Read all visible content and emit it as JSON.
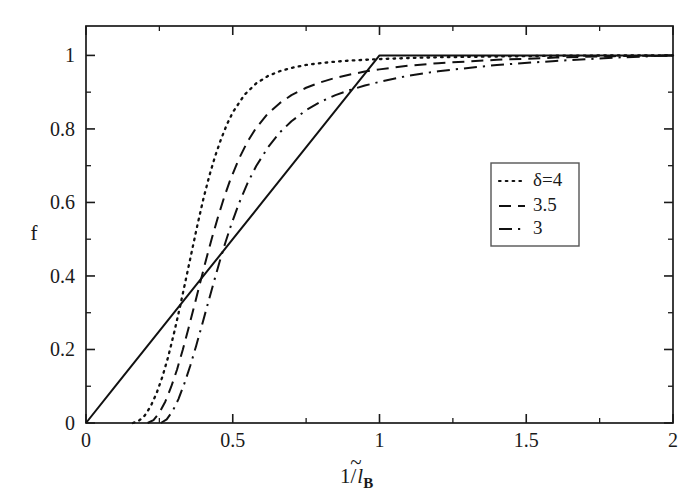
{
  "chart_data": {
    "type": "line",
    "title": "",
    "xlabel": "1/l̃_B",
    "xlabel_parts": {
      "prefix": "1/",
      "symbol": "l",
      "accent": "~",
      "subscript": "B"
    },
    "ylabel": "f",
    "xlim": [
      0,
      2
    ],
    "ylim": [
      0,
      1.08
    ],
    "grid": false,
    "legend_position": "center-right",
    "xticks": [
      "0",
      "0.5",
      "1",
      "1.5",
      "2"
    ],
    "xtick_values": [
      0,
      0.5,
      1,
      1.5,
      2
    ],
    "xminor_values": [
      0.25,
      0.75,
      1.25,
      1.75
    ],
    "yticks": [
      "0",
      "0.2",
      "0.4",
      "0.6",
      "0.8",
      "1"
    ],
    "ytick_values": [
      0,
      0.2,
      0.4,
      0.6,
      0.8,
      1
    ],
    "yminor_values": [
      0.1,
      0.3,
      0.5,
      0.7,
      0.9
    ],
    "series": [
      {
        "name": "linear",
        "style": "solid",
        "in_legend": false,
        "label": "",
        "points": [
          [
            0.0,
            0.0
          ],
          [
            0.1,
            0.1
          ],
          [
            0.2,
            0.2
          ],
          [
            0.3,
            0.3
          ],
          [
            0.4,
            0.4
          ],
          [
            0.5,
            0.5
          ],
          [
            0.6,
            0.6
          ],
          [
            0.7,
            0.7
          ],
          [
            0.8,
            0.8
          ],
          [
            0.9,
            0.9
          ],
          [
            1.0,
            1.0
          ],
          [
            1.2,
            1.0
          ],
          [
            1.4,
            1.0
          ],
          [
            1.6,
            1.0
          ],
          [
            1.8,
            1.0
          ],
          [
            2.0,
            1.0
          ]
        ]
      },
      {
        "name": "delta-4",
        "style": "dotted",
        "in_legend": true,
        "label": "δ=4",
        "points": [
          [
            0.16,
            0.0
          ],
          [
            0.18,
            0.006
          ],
          [
            0.2,
            0.02
          ],
          [
            0.22,
            0.045
          ],
          [
            0.24,
            0.08
          ],
          [
            0.26,
            0.125
          ],
          [
            0.28,
            0.18
          ],
          [
            0.3,
            0.245
          ],
          [
            0.32,
            0.315
          ],
          [
            0.34,
            0.39
          ],
          [
            0.36,
            0.465
          ],
          [
            0.38,
            0.54
          ],
          [
            0.4,
            0.61
          ],
          [
            0.42,
            0.672
          ],
          [
            0.44,
            0.726
          ],
          [
            0.46,
            0.772
          ],
          [
            0.48,
            0.812
          ],
          [
            0.5,
            0.845
          ],
          [
            0.54,
            0.893
          ],
          [
            0.58,
            0.924
          ],
          [
            0.62,
            0.944
          ],
          [
            0.66,
            0.957
          ],
          [
            0.7,
            0.966
          ],
          [
            0.75,
            0.974
          ],
          [
            0.8,
            0.979
          ],
          [
            0.85,
            0.983
          ],
          [
            0.9,
            0.986
          ],
          [
            0.95,
            0.988
          ],
          [
            1.0,
            0.99
          ],
          [
            1.1,
            0.993
          ],
          [
            1.2,
            0.995
          ],
          [
            1.4,
            0.997
          ],
          [
            1.6,
            0.999
          ],
          [
            1.8,
            1.0
          ],
          [
            2.0,
            1.0
          ]
        ]
      },
      {
        "name": "delta-3p5",
        "style": "dashed",
        "in_legend": true,
        "label": "3.5",
        "points": [
          [
            0.21,
            0.0
          ],
          [
            0.23,
            0.008
          ],
          [
            0.25,
            0.028
          ],
          [
            0.27,
            0.058
          ],
          [
            0.29,
            0.098
          ],
          [
            0.31,
            0.145
          ],
          [
            0.33,
            0.2
          ],
          [
            0.35,
            0.26
          ],
          [
            0.37,
            0.322
          ],
          [
            0.39,
            0.385
          ],
          [
            0.41,
            0.447
          ],
          [
            0.43,
            0.506
          ],
          [
            0.45,
            0.561
          ],
          [
            0.47,
            0.612
          ],
          [
            0.49,
            0.658
          ],
          [
            0.52,
            0.717
          ],
          [
            0.55,
            0.765
          ],
          [
            0.58,
            0.803
          ],
          [
            0.62,
            0.842
          ],
          [
            0.66,
            0.87
          ],
          [
            0.7,
            0.892
          ],
          [
            0.75,
            0.912
          ],
          [
            0.8,
            0.927
          ],
          [
            0.85,
            0.939
          ],
          [
            0.9,
            0.948
          ],
          [
            0.95,
            0.956
          ],
          [
            1.0,
            0.962
          ],
          [
            1.1,
            0.972
          ],
          [
            1.2,
            0.979
          ],
          [
            1.4,
            0.988
          ],
          [
            1.6,
            0.994
          ],
          [
            1.8,
            0.998
          ],
          [
            2.0,
            1.0
          ]
        ]
      },
      {
        "name": "delta-3",
        "style": "dashdot",
        "in_legend": true,
        "label": "3",
        "points": [
          [
            0.255,
            0.0
          ],
          [
            0.275,
            0.01
          ],
          [
            0.295,
            0.032
          ],
          [
            0.315,
            0.065
          ],
          [
            0.335,
            0.107
          ],
          [
            0.355,
            0.155
          ],
          [
            0.375,
            0.209
          ],
          [
            0.395,
            0.266
          ],
          [
            0.415,
            0.324
          ],
          [
            0.435,
            0.382
          ],
          [
            0.455,
            0.438
          ],
          [
            0.475,
            0.491
          ],
          [
            0.495,
            0.54
          ],
          [
            0.52,
            0.595
          ],
          [
            0.55,
            0.652
          ],
          [
            0.58,
            0.699
          ],
          [
            0.62,
            0.75
          ],
          [
            0.66,
            0.79
          ],
          [
            0.7,
            0.821
          ],
          [
            0.75,
            0.851
          ],
          [
            0.8,
            0.874
          ],
          [
            0.85,
            0.892
          ],
          [
            0.9,
            0.906
          ],
          [
            0.95,
            0.918
          ],
          [
            1.0,
            0.928
          ],
          [
            1.1,
            0.945
          ],
          [
            1.2,
            0.957
          ],
          [
            1.4,
            0.974
          ],
          [
            1.6,
            0.985
          ],
          [
            1.8,
            0.994
          ],
          [
            2.0,
            1.0
          ]
        ]
      }
    ],
    "legend_entries": [
      {
        "label": "δ=4",
        "style": "dotted"
      },
      {
        "label": "3.5",
        "style": "dashed"
      },
      {
        "label": "3",
        "style": "dashdot"
      }
    ]
  },
  "colors": {
    "curve": "#111111",
    "axis": "#1a1a1a",
    "legend_border": "#555555",
    "background": "#ffffff"
  }
}
